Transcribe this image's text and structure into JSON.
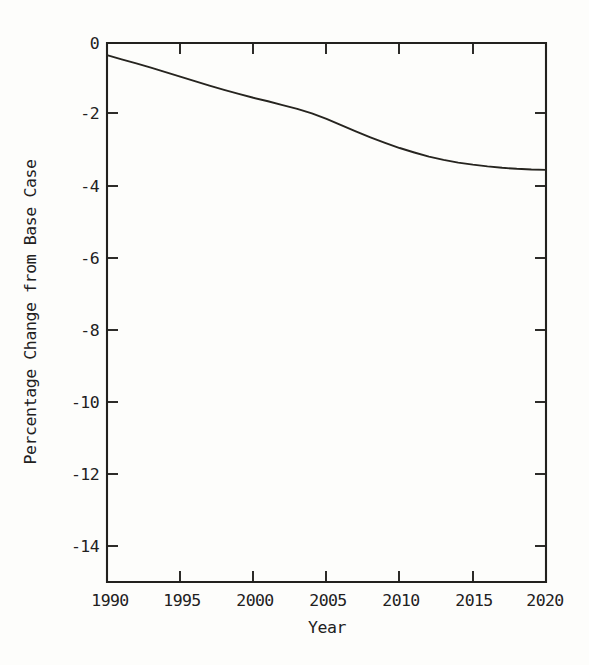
{
  "chart_data": {
    "type": "line",
    "title": "",
    "subtitle": "",
    "xlabel": "Year",
    "ylabel": "Percentage Change from Base Case",
    "xlim": [
      1990,
      2020
    ],
    "ylim": [
      -15.2,
      0.35
    ],
    "xticks": [
      1990,
      1995,
      2000,
      2005,
      2010,
      2015,
      2020
    ],
    "xtick_labels": [
      "1990",
      "1995",
      "2000",
      "2005",
      "2010",
      "2015",
      "2020"
    ],
    "yticks": [
      0,
      -2,
      -4,
      -6,
      -8,
      -10,
      -12,
      -14
    ],
    "ytick_labels": [
      "0",
      "-2",
      "-4",
      "-6",
      "-8",
      "-10",
      "-12",
      "-14"
    ],
    "grid": false,
    "legend": false,
    "legend_position": "none",
    "series": [
      {
        "name": "Percentage change from base case",
        "color": "#26241f",
        "x": [
          1990,
          1991,
          1992,
          1993,
          1994,
          1995,
          1996,
          1997,
          1998,
          1999,
          2000,
          2001,
          2002,
          2003,
          2004,
          2005,
          2006,
          2007,
          2008,
          2009,
          2010,
          2011,
          2012,
          2013,
          2014,
          2015,
          2016,
          2017,
          2018,
          2019,
          2020
        ],
        "values": [
          0.0,
          -0.12,
          -0.24,
          -0.36,
          -0.49,
          -0.62,
          -0.75,
          -0.88,
          -1.0,
          -1.12,
          -1.23,
          -1.33,
          -1.44,
          -1.55,
          -1.68,
          -1.84,
          -2.02,
          -2.2,
          -2.37,
          -2.53,
          -2.68,
          -2.81,
          -2.93,
          -3.02,
          -3.1,
          -3.16,
          -3.21,
          -3.25,
          -3.28,
          -3.3,
          -3.31
        ]
      }
    ]
  },
  "axes": {
    "x_axis_name": "Year",
    "y_axis_name": "Percentage Change from Base Case"
  }
}
